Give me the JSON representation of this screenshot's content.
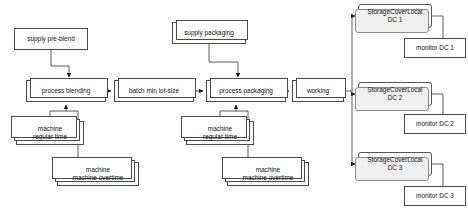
{
  "diagram": {
    "background_color": "#ffffff",
    "stroke_color": "#4a4a4a",
    "storage_fill": "#fdfdfd",
    "storage_shadow": "#efefef",
    "nodes": [
      {
        "id": "supply-pre-blend",
        "label": "supply pre-blend",
        "x": 14,
        "y": 28,
        "w": 74,
        "h": 22,
        "style": "plain"
      },
      {
        "id": "supply-packaging",
        "label": "supply packaging",
        "x": 172,
        "y": 22,
        "w": 74,
        "h": 22,
        "style": "stack2"
      },
      {
        "id": "process-blending",
        "label": "process blending",
        "x": 26,
        "y": 80,
        "w": 80,
        "h": 22,
        "style": "stack2"
      },
      {
        "id": "batch-min-lot-size",
        "label": "batch min lot-size",
        "x": 114,
        "y": 80,
        "w": 80,
        "h": 22,
        "style": "stack2"
      },
      {
        "id": "process-packaging",
        "label": "process packaging",
        "x": 206,
        "y": 80,
        "w": 80,
        "h": 22,
        "style": "stack2"
      },
      {
        "id": "working",
        "label": "working",
        "x": 292,
        "y": 80,
        "w": 52,
        "h": 22,
        "style": "stack2"
      },
      {
        "id": "machine-regular-time-1",
        "label": "machine\nregular time",
        "x": 16,
        "y": 121,
        "w": 68,
        "h": 24,
        "style": "stackL"
      },
      {
        "id": "machine-overtime-1",
        "label": "machine\nmachine overtime",
        "x": 57,
        "y": 162,
        "w": 82,
        "h": 24,
        "style": "stackL"
      },
      {
        "id": "machine-regular-time-2",
        "label": "machine\nregular time",
        "x": 186,
        "y": 121,
        "w": 68,
        "h": 24,
        "style": "stackL"
      },
      {
        "id": "machine-overtime-2",
        "label": "machine\nmachine overtime",
        "x": 227,
        "y": 162,
        "w": 82,
        "h": 24,
        "style": "stackL"
      },
      {
        "id": "storage-cover-local-dc-1",
        "label": "StorageCoverLocal\nDC 1",
        "x": 358,
        "y": 4,
        "w": 74,
        "h": 24,
        "style": "storage"
      },
      {
        "id": "storage-cover-local-dc-2",
        "label": "StorageCoverLocal\nDC 2",
        "x": 358,
        "y": 82,
        "w": 74,
        "h": 24,
        "style": "storage"
      },
      {
        "id": "storage-cover-local-dc-3",
        "label": "StorageCoverLocal\nDC 3",
        "x": 358,
        "y": 152,
        "w": 74,
        "h": 24,
        "style": "storage"
      },
      {
        "id": "monitor-dc-1",
        "label": "monitor DC 1",
        "x": 404,
        "y": 38,
        "w": 62,
        "h": 20,
        "style": "plain"
      },
      {
        "id": "monitor-dc-2",
        "label": "monitor DC 2",
        "x": 404,
        "y": 114,
        "w": 62,
        "h": 20,
        "style": "plain"
      },
      {
        "id": "monitor-dc-3",
        "label": "monitor DC 3",
        "x": 404,
        "y": 186,
        "w": 62,
        "h": 20,
        "style": "plain"
      }
    ],
    "edges": [
      {
        "id": "edge-supply-pre-blend-to-process-blending",
        "from": "supply-pre-blend",
        "to": "process-blending",
        "arrow": "down"
      },
      {
        "id": "edge-process-blending-to-batch",
        "from": "process-blending",
        "to": "batch-min-lot-size",
        "arrow": "right"
      },
      {
        "id": "edge-batch-to-process-packaging",
        "from": "batch-min-lot-size",
        "to": "process-packaging",
        "arrow": "right"
      },
      {
        "id": "edge-supply-packaging-to-process-packaging",
        "from": "supply-packaging",
        "to": "process-packaging",
        "arrow": "down"
      },
      {
        "id": "edge-process-packaging-to-working",
        "from": "process-packaging",
        "to": "working",
        "arrow": "right"
      },
      {
        "id": "edge-machine-regular-1-to-process-blending",
        "from": "machine-regular-time-1",
        "to": "process-blending",
        "arrow": "up"
      },
      {
        "id": "edge-machine-overtime-1-to-process-blending",
        "from": "machine-overtime-1",
        "to": "process-blending",
        "arrow": "up"
      },
      {
        "id": "edge-machine-regular-2-to-process-packaging",
        "from": "machine-regular-time-2",
        "to": "process-packaging",
        "arrow": "up"
      },
      {
        "id": "edge-machine-overtime-2-to-process-packaging",
        "from": "machine-overtime-2",
        "to": "process-packaging",
        "arrow": "up"
      },
      {
        "id": "edge-working-to-dc-1",
        "from": "working",
        "to": "storage-cover-local-dc-1",
        "arrow": "right"
      },
      {
        "id": "edge-working-to-dc-2",
        "from": "working",
        "to": "storage-cover-local-dc-2",
        "arrow": "right"
      },
      {
        "id": "edge-working-to-dc-3",
        "from": "working",
        "to": "storage-cover-local-dc-3",
        "arrow": "right"
      },
      {
        "id": "edge-dc-1-to-monitor-dc-1",
        "from": "storage-cover-local-dc-1",
        "to": "monitor-dc-1",
        "arrow": "none"
      },
      {
        "id": "edge-dc-2-to-monitor-dc-2",
        "from": "storage-cover-local-dc-2",
        "to": "monitor-dc-2",
        "arrow": "none"
      },
      {
        "id": "edge-dc-3-to-monitor-dc-3",
        "from": "storage-cover-local-dc-3",
        "to": "monitor-dc-3",
        "arrow": "none"
      }
    ]
  }
}
